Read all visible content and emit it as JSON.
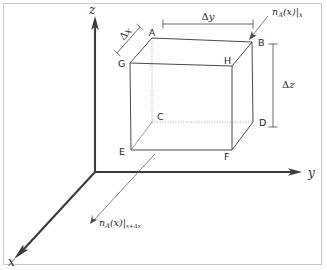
{
  "figure": {
    "type": "3d-coordinate-diagram"
  },
  "axes": {
    "x_label": "x",
    "y_label": "y",
    "z_label": "z"
  },
  "vertices": [
    {
      "id": "A",
      "label": "A"
    },
    {
      "id": "B",
      "label": "B"
    },
    {
      "id": "C",
      "label": "C"
    },
    {
      "id": "D",
      "label": "D"
    },
    {
      "id": "E",
      "label": "E"
    },
    {
      "id": "F",
      "label": "F"
    },
    {
      "id": "G",
      "label": "G"
    },
    {
      "id": "H",
      "label": "H"
    }
  ],
  "dimensions": {
    "delta_x": {
      "delta": "Δ",
      "var": "x"
    },
    "delta_y": {
      "delta": "Δ",
      "var": "y"
    },
    "delta_z": {
      "delta": "Δ",
      "var": "z"
    }
  },
  "flux_labels": {
    "inlet": {
      "symbol": "n",
      "species": "A",
      "argument": "(x)",
      "bar": "|",
      "evaluated_at": "x"
    },
    "outlet": {
      "symbol": "n",
      "species": "A",
      "argument": "(x)",
      "bar": "|",
      "evaluated_at": "x+Δx"
    }
  },
  "colors": {
    "background": "#ffffff",
    "frame": "#c9c9c9",
    "axis": "#3b3b3b",
    "cube_edge": "#4a4a4a",
    "hidden_edge": "#9a9a9a",
    "dimension": "#5a5a5a",
    "text": "#2a2a2a"
  }
}
